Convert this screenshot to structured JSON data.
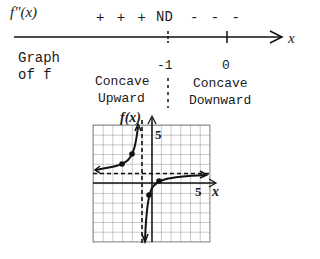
{
  "sign_chart": {
    "row_label": "f\"(x)",
    "signs_left": "+ + +",
    "critical_label": "ND",
    "signs_right": "- - -",
    "axis_variable": "x",
    "ticks": [
      {
        "label": "-1",
        "style": "dashed"
      },
      {
        "label": "0",
        "style": "solid"
      }
    ]
  },
  "graph_row": {
    "label_line1": "Graph",
    "label_line2": "of f",
    "left_interval": {
      "line1": "Concave",
      "line2": "Upward"
    },
    "right_interval": {
      "line1": "Concave",
      "line2": "Downward"
    }
  },
  "graph": {
    "y_axis_label": "f(x)",
    "x_axis_label": "x",
    "y_tick_label": "5",
    "x_tick_label": "5",
    "vertical_asymptote_x": -1,
    "horizontal_asymptote_y": 1
  }
}
